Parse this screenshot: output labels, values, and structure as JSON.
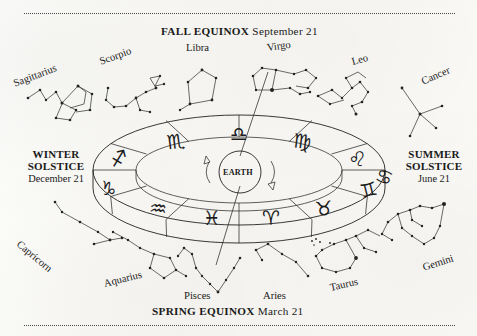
{
  "diagram": {
    "center_body": "EARTH",
    "ink_color": "#222222",
    "paper_color": "#fbfbf9"
  },
  "seasons": {
    "fall": {
      "name": "FALL EQUINOX",
      "date": "September 21"
    },
    "spring": {
      "name": "SPRING EQUINOX",
      "date": "March 21"
    },
    "winter": {
      "line1": "WINTER",
      "line2": "SOLSTICE",
      "date": "December 21"
    },
    "summer": {
      "line1": "SUMMER",
      "line2": "SOLSTICE",
      "date": "June 21"
    }
  },
  "zodiac_band": {
    "top_segments": [
      {
        "name": "Sagittarius",
        "glyph": "♐"
      },
      {
        "name": "Scorpio",
        "glyph": "♏"
      },
      {
        "name": "Libra",
        "glyph": "♎"
      },
      {
        "name": "Virgo",
        "glyph": "♍"
      },
      {
        "name": "Leo",
        "glyph": "♌"
      },
      {
        "name": "Cancer",
        "glyph": "♋"
      }
    ],
    "bottom_segments": [
      {
        "name": "Capricorn",
        "glyph": "♑"
      },
      {
        "name": "Aquarius",
        "glyph": "♒"
      },
      {
        "name": "Pisces",
        "glyph": "♓"
      },
      {
        "name": "Aries",
        "glyph": "♈"
      },
      {
        "name": "Taurus",
        "glyph": "♉"
      },
      {
        "name": "Gemini",
        "glyph": "♊"
      }
    ]
  },
  "constellation_labels": [
    {
      "name": "Sagittarius",
      "rotation": -21
    },
    {
      "name": "Scorpio",
      "rotation": -20
    },
    {
      "name": "Libra",
      "rotation": 0
    },
    {
      "name": "Virgo",
      "rotation": -8
    },
    {
      "name": "Leo",
      "rotation": -15
    },
    {
      "name": "Cancer",
      "rotation": -24
    },
    {
      "name": "Capricorn",
      "rotation": 40
    },
    {
      "name": "Aquarius",
      "rotation": -14
    },
    {
      "name": "Pisces",
      "rotation": 0
    },
    {
      "name": "Aries",
      "rotation": 0
    },
    {
      "name": "Taurus",
      "rotation": -13
    },
    {
      "name": "Gemini",
      "rotation": -18
    }
  ]
}
